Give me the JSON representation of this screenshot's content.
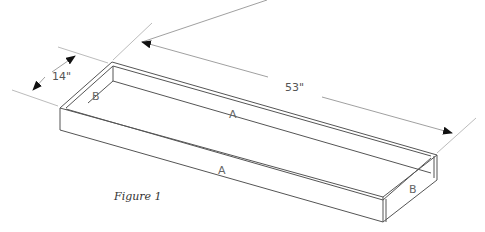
{
  "figure": {
    "caption": "Figure 1",
    "dimensions": {
      "width_label": "14\"",
      "length_label": "53\""
    },
    "part_labels": {
      "back_long_side": "A",
      "front_long_side": "A",
      "left_short_side": "B",
      "right_short_side": "B"
    },
    "colors": {
      "line": "#555555",
      "dimension_line": "#999999",
      "background": "#ffffff"
    }
  }
}
